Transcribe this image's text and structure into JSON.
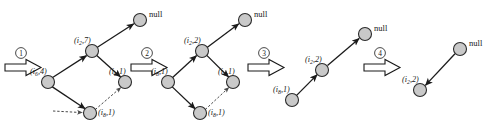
{
  "figure": {
    "background_color": "#ffffff",
    "node_fill": "#c9c9c9",
    "node_stroke": "#2b2b2b",
    "edge_color": "#1a1a1a",
    "null_label": "null"
  },
  "steps": [
    {
      "id": "step-1",
      "number": "1",
      "glyph": "①"
    },
    {
      "id": "step-2",
      "number": "2",
      "glyph": "②"
    },
    {
      "id": "step-3",
      "number": "3",
      "glyph": "③"
    },
    {
      "id": "step-4",
      "number": "4",
      "glyph": "④"
    }
  ],
  "stages": [
    {
      "id": "stage-1",
      "name": "diamond-stage-initial",
      "nodes": [
        {
          "id": "s1-null",
          "name": "null-node",
          "label_main": "null",
          "label_italic": false,
          "cx": 140,
          "cy": 20,
          "r": 6.5
        },
        {
          "id": "s1-top",
          "name": "node-top",
          "label_prefix": "(i",
          "label_sub": "2",
          "label_suffix": ",7)",
          "label_italic": true,
          "cx": 92,
          "cy": 51,
          "r": 6.5
        },
        {
          "id": "s1-left",
          "name": "node-left",
          "label_prefix": "(i",
          "label_sub": "6",
          "label_suffix": ",4)",
          "label_italic": true,
          "cx": 48,
          "cy": 82,
          "r": 6.5
        },
        {
          "id": "s1-right",
          "name": "node-right",
          "label_prefix": "(i",
          "label_sub": "8",
          "label_suffix": ",1)",
          "label_italic": true,
          "cx": 125,
          "cy": 82,
          "r": 6.5
        },
        {
          "id": "s1-bottom",
          "name": "node-bottom",
          "label_prefix": "(i",
          "label_sub": "8",
          "label_suffix": ",1)",
          "label_italic": true,
          "cx": 90,
          "cy": 113,
          "r": 6.5
        }
      ]
    },
    {
      "id": "stage-2",
      "name": "diamond-stage-second",
      "nodes": [
        {
          "id": "s2-null",
          "name": "null-node",
          "label_main": "null",
          "label_italic": false,
          "cx": 245,
          "cy": 20,
          "r": 6.5
        },
        {
          "id": "s2-top",
          "name": "node-top",
          "label_prefix": "(i",
          "label_sub": "2",
          "label_suffix": ",2)",
          "label_italic": true,
          "cx": 202,
          "cy": 51,
          "r": 6.5
        },
        {
          "id": "s2-left",
          "name": "node-left",
          "label_prefix": "(i",
          "label_sub": "8",
          "label_suffix": ",1)",
          "label_italic": true,
          "cx": 168,
          "cy": 82,
          "r": 6.5
        },
        {
          "id": "s2-right",
          "name": "node-right",
          "label_prefix": "(i",
          "label_sub": "4",
          "label_suffix": ",1)",
          "label_italic": true,
          "cx": 233,
          "cy": 82,
          "r": 6.5
        },
        {
          "id": "s2-bottom",
          "name": "node-bottom",
          "label_prefix": "(i",
          "label_sub": "8",
          "label_suffix": ",1)",
          "label_italic": true,
          "cx": 200,
          "cy": 113,
          "r": 6.5
        }
      ]
    },
    {
      "id": "stage-3",
      "name": "chain-stage-third",
      "nodes": [
        {
          "id": "s3-null",
          "name": "null-node",
          "label_main": "null",
          "label_italic": false,
          "cx": 365,
          "cy": 34,
          "r": 6.5
        },
        {
          "id": "s3-mid",
          "name": "node-middle",
          "label_prefix": "(i",
          "label_sub": "2",
          "label_suffix": ",2)",
          "label_italic": true,
          "cx": 322,
          "cy": 70,
          "r": 6.5
        },
        {
          "id": "s3-low",
          "name": "node-lower",
          "label_prefix": "(i",
          "label_sub": "8",
          "label_suffix": ",1)",
          "label_italic": true,
          "cx": 292,
          "cy": 100,
          "r": 6.5
        }
      ]
    },
    {
      "id": "stage-4",
      "name": "chain-stage-final",
      "nodes": [
        {
          "id": "s4-null",
          "name": "null-node",
          "label_main": "null",
          "label_italic": false,
          "cx": 460,
          "cy": 49,
          "r": 6.5
        },
        {
          "id": "s4-low",
          "name": "node-lower",
          "label_prefix": "(i",
          "label_sub": "2",
          "label_suffix": ",2)",
          "label_italic": true,
          "cx": 420,
          "cy": 90,
          "r": 6.5
        }
      ]
    }
  ],
  "labels": {
    "s1_null": "null",
    "s1_top": {
      "prefix": "(i",
      "sub": "2",
      "suffix": ",7)"
    },
    "s1_left": {
      "prefix": "(i",
      "sub": "6",
      "suffix": ",4)"
    },
    "s1_right": {
      "prefix": "(i",
      "sub": "8",
      "suffix": ",1)"
    },
    "s1_bottom": {
      "prefix": "(i",
      "sub": "8",
      "suffix": ",1)"
    },
    "s2_null": "null",
    "s2_top": {
      "prefix": "(i",
      "sub": "2",
      "suffix": ",2)"
    },
    "s2_left": {
      "prefix": "(i",
      "sub": "8",
      "suffix": ",1)"
    },
    "s2_right": {
      "prefix": "(i",
      "sub": "4",
      "suffix": ",1)"
    },
    "s2_bottom": {
      "prefix": "(i",
      "sub": "8",
      "suffix": ",1)"
    },
    "s3_null": "null",
    "s3_mid": {
      "prefix": "(i",
      "sub": "2",
      "suffix": ",2)"
    },
    "s3_low": {
      "prefix": "(i",
      "sub": "8",
      "suffix": ",1)"
    },
    "s4_null": "null",
    "s4_low": {
      "prefix": "(i",
      "sub": "2",
      "suffix": ",2)"
    }
  },
  "step_glyphs": {
    "one": "①",
    "two": "②",
    "three": "③",
    "four": "④"
  }
}
